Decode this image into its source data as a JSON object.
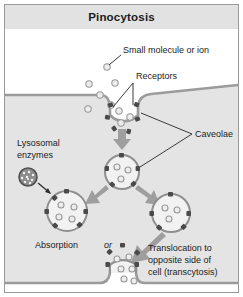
{
  "figure": {
    "title": "Pinocytosis",
    "background_color": "#ffffff",
    "frame_border_color": "#9a9a9a",
    "title_bar_color": "#e2e2e2"
  },
  "colors": {
    "cytoplasm": "#e4e4e4",
    "membrane": "#9b9b9b",
    "membrane_dark": "#7d7d7d",
    "vesicle_fill": "#f2f2f2",
    "vesicle_stroke": "#8f8f8f",
    "molecule_fill": "#e9e9e9",
    "molecule_stroke": "#9a9a9a",
    "receptor": "#4a4a4a",
    "arrow": "#9e9e9e",
    "lysosome": "#7a7a7a",
    "leader_line": "#3a3a3a",
    "text": "#1b1b1b"
  },
  "labels": {
    "small_molecule": "Small molecule or ion",
    "receptors": "Receptors",
    "caveolae": "Caveolae",
    "lysosomal_enzymes_line1": "Lysosomal",
    "lysosomal_enzymes_line2": "enzymes",
    "absorption": "Absorption",
    "or": "or",
    "translocation_line1": "Translocation to",
    "translocation_line2": "opposite side of",
    "translocation_line3": "cell (transcytosis)"
  },
  "diagram": {
    "type": "biology-process-diagram",
    "extracellular_region": "above top membrane",
    "intracellular_region": "between top and bottom membranes",
    "steps": [
      "Small molecules or ions bind receptors in a membrane caveola",
      "Caveola invaginates and pinches off to form a coated vesicle",
      "Vesicle fuses with lysosome delivering lysosomal enzymes for absorption",
      "Alternatively vesicle translocates to opposite side of cell and exocytoses (transcytosis)"
    ],
    "free_molecules": [
      {
        "cx": 102,
        "cy": 38,
        "r": 3.2
      },
      {
        "cx": 84,
        "cy": 55,
        "r": 3.2
      },
      {
        "cx": 110,
        "cy": 54,
        "r": 3.2
      },
      {
        "cx": 95,
        "cy": 66,
        "r": 3.2
      },
      {
        "cx": 105,
        "cy": 76,
        "r": 3.2
      },
      {
        "cx": 82,
        "cy": 80,
        "r": 3.2
      }
    ],
    "vesicles": [
      {
        "name": "caveola-pocket",
        "cx": 115,
        "cy": 83,
        "r": 19
      },
      {
        "name": "vesicle-pinched",
        "cx": 117,
        "cy": 127,
        "r": 17
      },
      {
        "name": "vesicle-absorption",
        "cx": 62,
        "cy": 175,
        "r": 20
      },
      {
        "name": "vesicle-transcytosis",
        "cx": 166,
        "cy": 177,
        "r": 19
      },
      {
        "name": "vesicle-fusing",
        "cx": 124,
        "cy": 243,
        "r": 20
      }
    ],
    "lysosome": {
      "cx": 27,
      "cy": 148,
      "r": 9
    }
  }
}
